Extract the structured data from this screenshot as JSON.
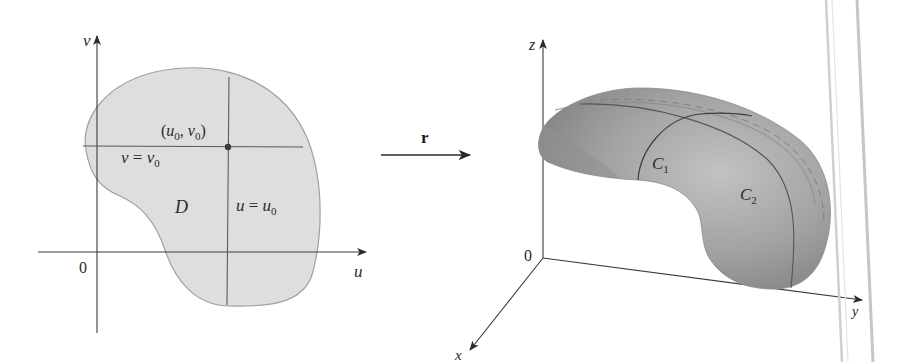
{
  "figure": {
    "left_panel": {
      "title": "Parameter domain D in the uv-plane",
      "axes": {
        "vertical_label": "v",
        "horizontal_label": "u",
        "origin_label": "0"
      },
      "region_label": "D",
      "point_label": "(u₀, v₀)",
      "point_label_parts": {
        "open": "(",
        "u": "u",
        "u_sub": "0",
        "comma": ", ",
        "v": "v",
        "v_sub": "0",
        "close": ")"
      },
      "horizontal_line_label": {
        "lhs": "v",
        "eq": " = ",
        "rhs": "v",
        "sub": "0"
      },
      "vertical_line_label": {
        "lhs": "u",
        "eq": " = ",
        "rhs": "u",
        "sub": "0"
      }
    },
    "mapping_arrow": {
      "label": "r"
    },
    "right_panel": {
      "title": "Parametric surface in xyz-space",
      "axes": {
        "z_label": "z",
        "y_label": "y",
        "x_label": "x",
        "origin_label": "0"
      },
      "curve_labels": [
        {
          "name": "C",
          "sub": "1"
        },
        {
          "name": "C",
          "sub": "2"
        }
      ]
    },
    "colors": {
      "region_fill": "#dcdcdc",
      "region_stroke": "#9a9a9a",
      "line": "#4a4a4a",
      "axis": "#3a3a3a",
      "surface_light": "#bdbdbd",
      "surface_mid": "#9c9c9c",
      "surface_dark": "#7d7d7d",
      "page_edge": "#c8c8c8"
    }
  }
}
